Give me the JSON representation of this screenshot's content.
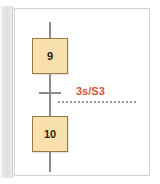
{
  "figure": {
    "kind": "sfc-grafcet-fragment",
    "background_color": "#ffffff",
    "frame_border_color": "#d2d2d2"
  },
  "diagram": {
    "steps": [
      {
        "id": "step-9",
        "label": "9",
        "fill_color": "#f7dfae",
        "border_color": "#9a7b42"
      },
      {
        "id": "step-10",
        "label": "10",
        "fill_color": "#f7dfae",
        "border_color": "#9a7b42"
      }
    ],
    "transition": {
      "condition_label": "3s/S3",
      "condition_color": "#d2543b",
      "bar_color": "#8b8b8b",
      "leader_style": "dotted",
      "leader_color": "#9a9a9a"
    },
    "links": {
      "color": "#8b8b8b"
    }
  }
}
